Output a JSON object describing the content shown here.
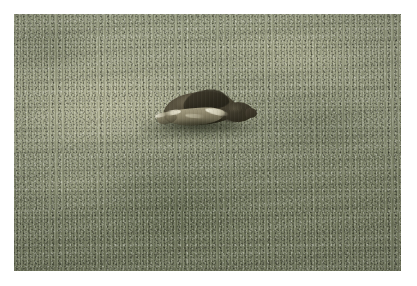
{
  "image": {
    "kind": "photograph",
    "subject": "snapping turtle on a mowed grass lawn",
    "orientation": "landscape",
    "border_style": "white mat border",
    "caption": "",
    "colors": {
      "mat": "#ffffff",
      "grass_light": "#9ba084",
      "grass_mid": "#8a8f74",
      "grass_dark": "#787e63",
      "dry_grass": "#c4c3a4",
      "shell_dark": "#33301f",
      "shell_mid": "#57513f",
      "shell_highlight": "#ece9d6",
      "head_dark": "#2a2719",
      "shadow": "#303424"
    }
  },
  "scene": {
    "background_label": "grass lawn",
    "subject_label": "turtle",
    "parts": [
      {
        "name": "carapace",
        "label": "shell"
      },
      {
        "name": "carapace-hump",
        "label": "shell ridge"
      },
      {
        "name": "plastron-flank",
        "label": "lower shell"
      },
      {
        "name": "head",
        "label": "head"
      },
      {
        "name": "snout",
        "label": "snout"
      },
      {
        "name": "front-leg",
        "label": "front leg"
      },
      {
        "name": "turtle-shadow",
        "label": "cast shadow"
      }
    ]
  },
  "frame": {
    "photo_left": 14,
    "photo_top": 14,
    "photo_width": 387,
    "photo_height": 257
  }
}
